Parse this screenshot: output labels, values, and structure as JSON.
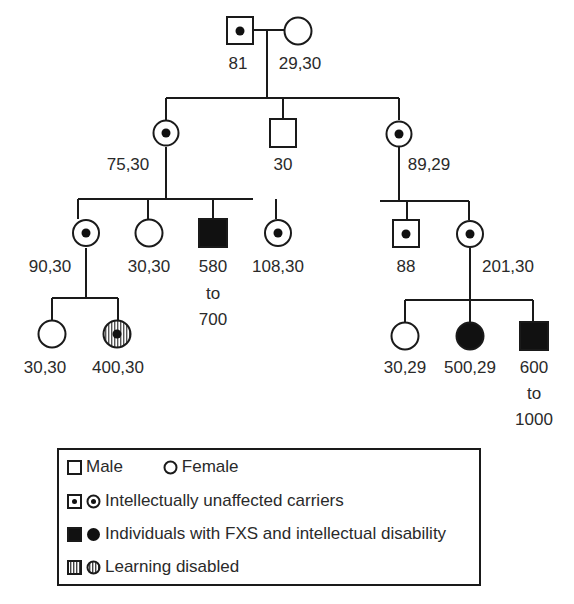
{
  "diagram": {
    "type": "pedigree"
  },
  "generations": {
    "g1": {
      "father": {
        "sex": "male",
        "status": "carrier",
        "label": "81"
      },
      "mother": {
        "sex": "female",
        "status": "unaffected",
        "label": "29,30"
      }
    },
    "g2": [
      {
        "sex": "female",
        "status": "carrier",
        "label": "75,30"
      },
      {
        "sex": "male",
        "status": "unaffected",
        "label": "30"
      },
      {
        "sex": "female",
        "status": "carrier",
        "label": "89,29"
      }
    ],
    "g3_left": [
      {
        "sex": "female",
        "status": "carrier",
        "label": "90,30"
      },
      {
        "sex": "female",
        "status": "unaffected",
        "label": "30,30"
      },
      {
        "sex": "male",
        "status": "affected",
        "label_lines": [
          "580",
          "to",
          "700"
        ]
      },
      {
        "sex": "female",
        "status": "carrier",
        "label": "108,30"
      }
    ],
    "g3_right": [
      {
        "sex": "male",
        "status": "carrier",
        "label": "88"
      },
      {
        "sex": "female",
        "status": "carrier",
        "label": "201,30"
      }
    ],
    "g4_left": [
      {
        "sex": "female",
        "status": "unaffected",
        "label": "30,30"
      },
      {
        "sex": "female",
        "status": "learning-disabled",
        "label": "400,30"
      }
    ],
    "g4_right": [
      {
        "sex": "female",
        "status": "unaffected",
        "label": "30,29"
      },
      {
        "sex": "female",
        "status": "affected",
        "label": "500,29"
      },
      {
        "sex": "male",
        "status": "affected",
        "label_lines": [
          "600",
          "to",
          "1000"
        ]
      }
    ]
  },
  "legend": {
    "row1_male": "Male",
    "row1_female": "Female",
    "carriers": "Intellectually unaffected carriers",
    "affected": "Individuals with FXS and intellectual disability",
    "learning": "Learning disabled"
  },
  "colors": {
    "line": "#1a1a1a",
    "fill_affected": "#111111",
    "text": "#2a2a2a"
  }
}
